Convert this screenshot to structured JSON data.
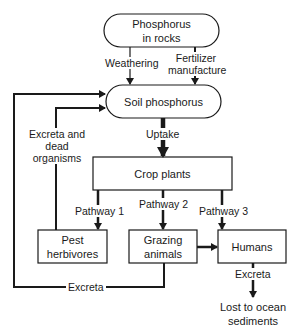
{
  "diagram": {
    "nodes": {
      "rocks": {
        "line1": "Phosphorus",
        "line2": "in rocks"
      },
      "soil": {
        "label": "Soil phosphorus"
      },
      "crops": {
        "label": "Crop plants"
      },
      "pests": {
        "line1": "Pest",
        "line2": "herbivores"
      },
      "grazing": {
        "line1": "Grazing",
        "line2": "animals"
      },
      "humans": {
        "label": "Humans"
      },
      "ocean": {
        "line1": "Lost to ocean",
        "line2": "sediments"
      }
    },
    "edges": {
      "weathering": "Weathering",
      "fertilizer_line1": "Fertilizer",
      "fertilizer_line2": "manufacture",
      "uptake": "Uptake",
      "pathway1": "Pathway 1",
      "pathway2": "Pathway 2",
      "pathway3": "Pathway 3",
      "excreta_dead_line1": "Excreta and",
      "excreta_dead_line2": "dead",
      "excreta_dead_line3": "organisms",
      "excreta_bottom": "Excreta",
      "excreta_humans": "Excreta"
    },
    "colors": {
      "stroke": "#1a1a1a",
      "background": "#ffffff"
    }
  }
}
